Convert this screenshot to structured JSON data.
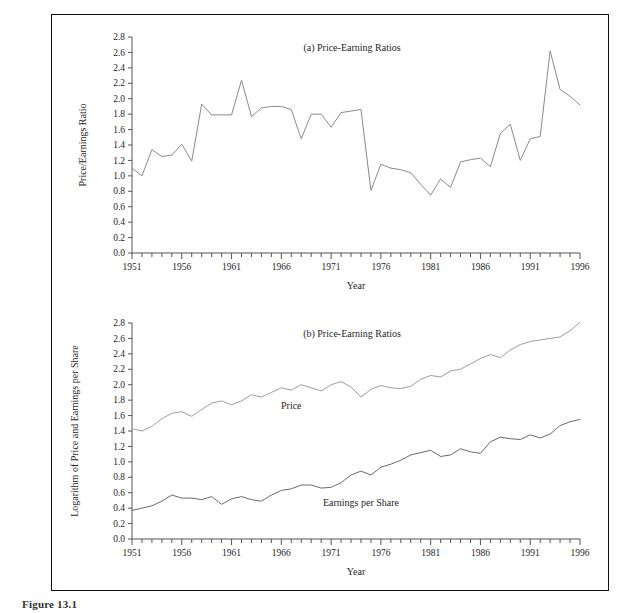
{
  "figure": {
    "caption_label": "Figure 13.1",
    "caption_text": ""
  },
  "panels": [
    {
      "key": "panel_a",
      "title": "(a) Price-Earning Ratios",
      "xlabel": "Year",
      "ylabel": "Price/Earnings Ratio"
    },
    {
      "key": "panel_b",
      "title": "(b) Price-Earning Ratios",
      "xlabel": "Year",
      "ylabel": "Logarithm of Price and Earnings per Share"
    }
  ],
  "axis": {
    "y_ticks": [
      "0.0",
      "0.2",
      "0.4",
      "0.6",
      "0.8",
      "1.0",
      "1.2",
      "1.4",
      "1.6",
      "1.8",
      "2.0",
      "2.2",
      "2.4",
      "2.6",
      "2.8"
    ],
    "x_ticks_labeled": [
      "1951",
      "1956",
      "1961",
      "1966",
      "1971",
      "1976",
      "1981",
      "1986",
      "1991",
      "1996"
    ],
    "y_min": 0.0,
    "y_max": 2.8,
    "x_min": 1951,
    "x_max": 1996
  },
  "colors": {
    "frame": "#111111",
    "axis": "#555555",
    "ratio_line": "#8a8a8a",
    "price_line": "#9e9e9e",
    "earnings_line": "#6b6b6b",
    "text": "#262626",
    "background": "#ffffff"
  },
  "chart_data": [
    {
      "type": "line",
      "id": "panel_a",
      "title": "(a) Price-Earning Ratios",
      "xlabel": "Year",
      "ylabel": "Price/Earnings Ratio",
      "xlim": [
        1951,
        1996
      ],
      "ylim": [
        0.0,
        2.8
      ],
      "grid": false,
      "legend": "none",
      "x": [
        1951,
        1952,
        1953,
        1954,
        1955,
        1956,
        1957,
        1958,
        1959,
        1960,
        1961,
        1962,
        1963,
        1964,
        1965,
        1966,
        1967,
        1968,
        1969,
        1970,
        1971,
        1972,
        1973,
        1974,
        1975,
        1976,
        1977,
        1978,
        1979,
        1980,
        1981,
        1982,
        1983,
        1984,
        1985,
        1986,
        1987,
        1988,
        1989,
        1990,
        1991,
        1992,
        1993,
        1994,
        1995,
        1996
      ],
      "series": [
        {
          "name": "Price/Earnings Ratio",
          "values": [
            1.1,
            1.0,
            1.34,
            1.25,
            1.27,
            1.41,
            1.19,
            1.93,
            1.79,
            1.79,
            1.79,
            2.24,
            1.77,
            1.88,
            1.9,
            1.9,
            1.86,
            1.48,
            1.8,
            1.8,
            1.63,
            1.82,
            1.84,
            1.86,
            0.81,
            1.15,
            1.1,
            1.08,
            1.04,
            0.89,
            0.75,
            0.96,
            0.85,
            1.18,
            1.21,
            1.23,
            1.12,
            1.55,
            1.67,
            1.2,
            1.48,
            1.51,
            2.62,
            2.12,
            2.03,
            1.92
          ]
        }
      ]
    },
    {
      "type": "line",
      "id": "panel_b",
      "title": "(b) Price-Earning Ratios",
      "xlabel": "Year",
      "ylabel": "Logarithm of Price and Earnings per Share",
      "xlim": [
        1951,
        1996
      ],
      "ylim": [
        0.0,
        2.8
      ],
      "grid": false,
      "legend": "inline labels",
      "annotations": [
        {
          "text": "Price",
          "x": 1967,
          "y": 1.68
        },
        {
          "text": "Earnings per Share",
          "x": 1974,
          "y": 0.43
        }
      ],
      "x": [
        1951,
        1952,
        1953,
        1954,
        1955,
        1956,
        1957,
        1958,
        1959,
        1960,
        1961,
        1962,
        1963,
        1964,
        1965,
        1966,
        1967,
        1968,
        1969,
        1970,
        1971,
        1972,
        1973,
        1974,
        1975,
        1976,
        1977,
        1978,
        1979,
        1980,
        1981,
        1982,
        1983,
        1984,
        1985,
        1986,
        1987,
        1988,
        1989,
        1990,
        1991,
        1992,
        1993,
        1994,
        1995,
        1996
      ],
      "series": [
        {
          "name": "Price",
          "values": [
            1.43,
            1.4,
            1.46,
            1.56,
            1.63,
            1.65,
            1.59,
            1.68,
            1.76,
            1.79,
            1.74,
            1.79,
            1.87,
            1.84,
            1.9,
            1.96,
            1.93,
            2.0,
            1.96,
            1.92,
            2.0,
            2.04,
            1.97,
            1.84,
            1.94,
            1.99,
            1.96,
            1.95,
            1.98,
            2.07,
            2.12,
            2.1,
            2.18,
            2.2,
            2.27,
            2.34,
            2.39,
            2.35,
            2.45,
            2.52,
            2.56,
            2.58,
            2.6,
            2.62,
            2.7,
            2.81
          ]
        },
        {
          "name": "Earnings per Share",
          "values": [
            0.37,
            0.4,
            0.43,
            0.49,
            0.57,
            0.53,
            0.53,
            0.51,
            0.55,
            0.45,
            0.52,
            0.55,
            0.51,
            0.49,
            0.57,
            0.63,
            0.65,
            0.7,
            0.7,
            0.66,
            0.67,
            0.73,
            0.83,
            0.88,
            0.83,
            0.93,
            0.97,
            1.02,
            1.09,
            1.12,
            1.15,
            1.07,
            1.09,
            1.17,
            1.13,
            1.11,
            1.26,
            1.32,
            1.3,
            1.29,
            1.35,
            1.31,
            1.36,
            1.47,
            1.52,
            1.55
          ]
        }
      ]
    }
  ]
}
